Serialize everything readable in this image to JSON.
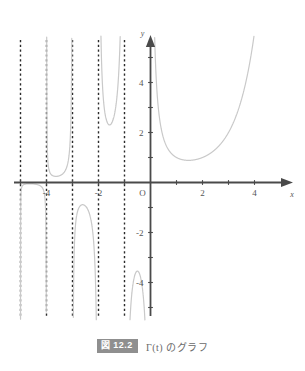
{
  "figure": {
    "caption_tag": "図 12.2",
    "caption_text": "Γ(t) のグラフ",
    "tag_background": "#8f8f8f",
    "tag_color": "#ffffff",
    "caption_color": "#6a6a6a"
  },
  "chart_data": {
    "type": "line",
    "title": "",
    "subtitle": "",
    "xlabel": "x",
    "ylabel": "y",
    "function": "Gamma(t)",
    "xlim": [
      -5.2,
      4.6
    ],
    "ylim": [
      -5.8,
      5.9
    ],
    "grid": false,
    "legend": null,
    "curve_color": "#c9c9c9",
    "axis_color": "#4a4a4a",
    "asymptote_color": "#2b2b2b",
    "asymptote_style": "dashed",
    "origin_label": "O",
    "xticks": [
      -5,
      -4,
      -3,
      -2,
      -1,
      1,
      2,
      3,
      4
    ],
    "xtick_labels": [
      {
        "value": -4,
        "label": "-4"
      },
      {
        "value": -2,
        "label": "-2"
      },
      {
        "value": 2,
        "label": "2"
      },
      {
        "value": 4,
        "label": "4"
      }
    ],
    "yticks": [
      -5,
      -4,
      -3,
      -2,
      -1,
      1,
      2,
      3,
      4,
      5
    ],
    "ytick_labels": [
      {
        "value": 4,
        "label": "4"
      },
      {
        "value": 2,
        "label": "2"
      },
      {
        "value": -2,
        "label": "-2"
      },
      {
        "value": -4,
        "label": "-4"
      }
    ],
    "asymptotes": [
      -5,
      -4,
      -3,
      -2,
      -1
    ],
    "branches": [
      {
        "name": "branch-neg-5-to-neg-4",
        "domain": [
          -5,
          -4
        ],
        "sign": "positive-left-negative-right",
        "local_extremum": {
          "x": -4.48,
          "y": -0.0018
        }
      },
      {
        "name": "branch-neg-4-to-neg-3",
        "domain": [
          -4,
          -3
        ],
        "sign": "positive",
        "local_extremum": {
          "x": -3.48,
          "y": 0.246
        }
      },
      {
        "name": "branch-neg-3-to-neg-2",
        "domain": [
          -3,
          -2
        ],
        "sign": "negative",
        "local_extremum": {
          "x": -2.46,
          "y": -0.895
        }
      },
      {
        "name": "branch-neg-2-to-neg-1",
        "domain": [
          -2,
          -1
        ],
        "sign": "positive",
        "local_extremum": {
          "x": -1.57,
          "y": 2.302
        }
      },
      {
        "name": "branch-neg-1-to-0",
        "domain": [
          -1,
          0
        ],
        "sign": "negative",
        "local_extremum": {
          "x": -0.504,
          "y": -3.545
        }
      },
      {
        "name": "branch-positive",
        "domain": [
          0,
          4.4
        ],
        "sign": "positive",
        "local_extremum": {
          "x": 1.4616,
          "y": 0.8856
        }
      }
    ]
  }
}
